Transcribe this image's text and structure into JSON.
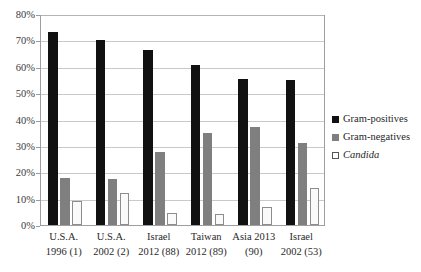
{
  "chart_data": {
    "type": "bar",
    "title": "",
    "xlabel": "",
    "ylabel": "",
    "ylim": [
      0,
      80
    ],
    "y_tick_step": 10,
    "y_ticks": [
      "0%",
      "10%",
      "20%",
      "30%",
      "40%",
      "50%",
      "60%",
      "70%",
      "80%"
    ],
    "grid": true,
    "legend_position": "right",
    "categories": [
      "U.S.A. 1996 (1)",
      "U.S.A. 2002 (2)",
      "Israel 2012 (88)",
      "Taiwan 2012 (89)",
      "Asia 2013 (90)",
      "Israel 2002 (53)"
    ],
    "category_lines": [
      [
        "U.S.A.",
        "1996 (1)"
      ],
      [
        "U.S.A.",
        "2002 (2)"
      ],
      [
        "Israel",
        "2012 (88)"
      ],
      [
        "Taiwan",
        "2012 (89)"
      ],
      [
        "Asia 2013",
        "(90)"
      ],
      [
        "Israel",
        "2002 (53)"
      ]
    ],
    "series": [
      {
        "name": "Gram-positives",
        "color": "#111111",
        "italic": false,
        "values": [
          73,
          70,
          66.5,
          60.5,
          55.5,
          55
        ]
      },
      {
        "name": "Gram-negatives",
        "color": "#7f7f7f",
        "italic": false,
        "values": [
          18,
          17.5,
          27.5,
          35,
          37,
          31
        ]
      },
      {
        "name": "Candida",
        "color": "#ffffff",
        "italic": true,
        "values": [
          9,
          12,
          4.5,
          4,
          7,
          14
        ]
      }
    ]
  }
}
